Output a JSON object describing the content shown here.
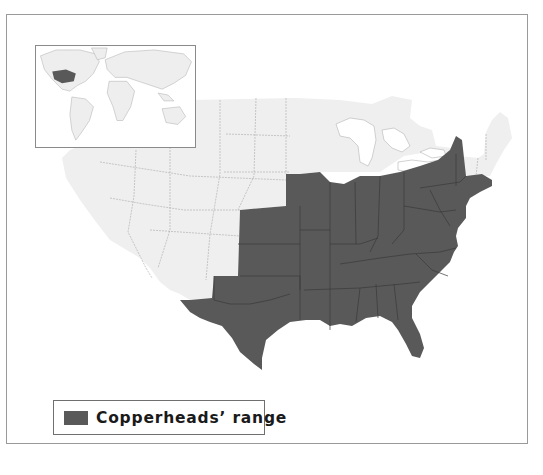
{
  "map": {
    "title": "Copperheads' range map",
    "region": "United States (contiguous)",
    "colors": {
      "range_fill": "#595959",
      "non_range_fill": "#efefef",
      "state_border_range": "#3a3a3a",
      "state_border_other": "#a8a8a8",
      "frame_border": "#9a9a9a",
      "background": "#ffffff"
    },
    "range_states": [
      "Texas",
      "Oklahoma",
      "Kansas",
      "Nebraska (southeast)",
      "Iowa",
      "Missouri",
      "Arkansas",
      "Louisiana",
      "Illinois",
      "Indiana",
      "Ohio",
      "Kentucky",
      "Tennessee",
      "Mississippi",
      "Alabama",
      "Georgia",
      "Florida",
      "South Carolina",
      "North Carolina",
      "Virginia",
      "West Virginia",
      "Maryland",
      "Delaware",
      "Pennsylvania",
      "New Jersey",
      "New York",
      "Connecticut",
      "Massachusetts",
      "Rhode Island"
    ]
  },
  "inset": {
    "label": "World locator map",
    "highlight": "Southeastern United States"
  },
  "legend": {
    "swatch_color": "#595959",
    "label": "Copperheads’ range"
  }
}
